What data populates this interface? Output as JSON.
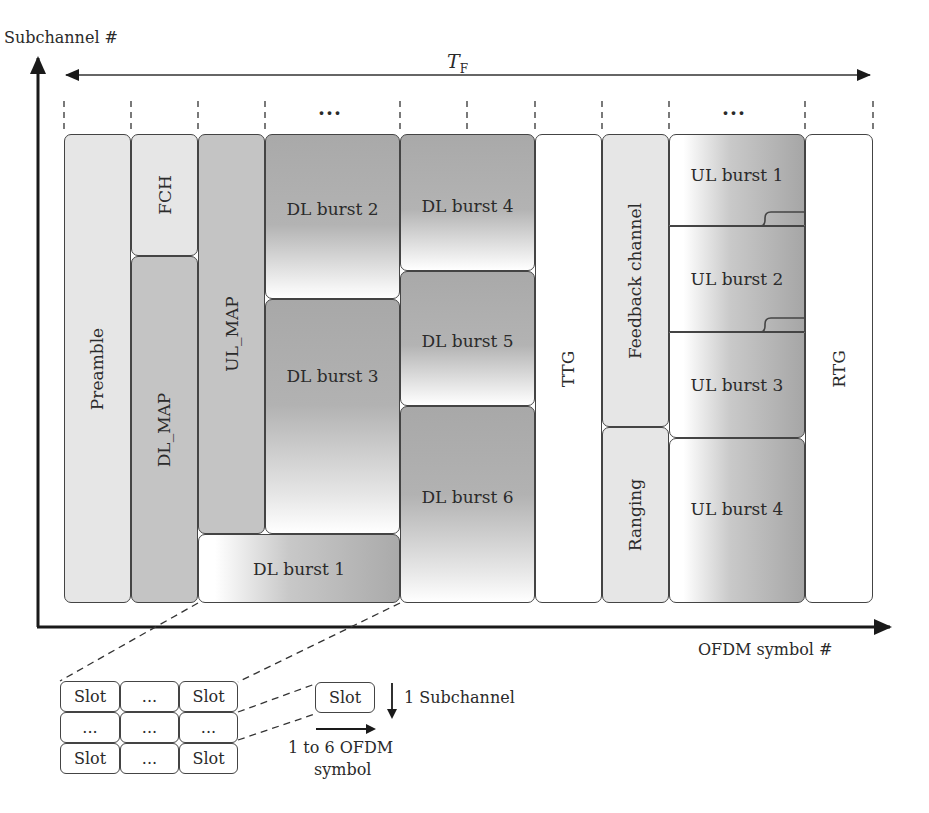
{
  "axes": {
    "y_label": "Subchannel #",
    "x_label": "OFDM symbol #",
    "frame_duration_label": "T",
    "frame_duration_subscript": "F"
  },
  "ellipsis_markers": [
    "...",
    "..."
  ],
  "frame_blocks": {
    "preamble": "Preamble",
    "fch": "FCH",
    "dl_map": "DL_MAP",
    "ul_map": "UL_MAP",
    "dl_burst_1": "DL burst 1",
    "dl_burst_2": "DL burst 2",
    "dl_burst_3": "DL burst 3",
    "dl_burst_4": "DL burst 4",
    "dl_burst_5": "DL burst 5",
    "dl_burst_6": "DL burst 6",
    "ttg": "TTG",
    "feedback_channel": "Feedback channel",
    "ranging": "Ranging",
    "ul_burst_1": "UL burst 1",
    "ul_burst_2": "UL burst 2",
    "ul_burst_3": "UL burst 3",
    "ul_burst_4": "UL burst 4",
    "rtg": "RTG"
  },
  "slot_grid": {
    "rows": [
      [
        "Slot",
        "...",
        "Slot"
      ],
      [
        "...",
        "...",
        "..."
      ],
      [
        "Slot",
        "...",
        "Slot"
      ]
    ]
  },
  "slot_legend": {
    "slot_label": "Slot",
    "subchannel_label": "1 Subchannel",
    "symbol_label_line1": "1 to 6 OFDM",
    "symbol_label_line2": "symbol"
  }
}
